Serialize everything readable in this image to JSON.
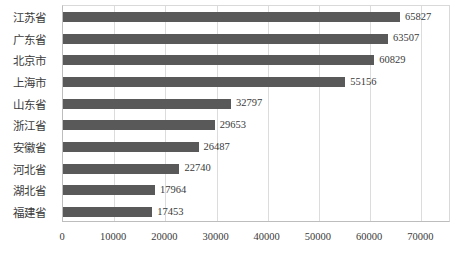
{
  "chart_data": {
    "type": "bar",
    "orientation": "horizontal",
    "title": "",
    "subtitle": "",
    "xlabel": "",
    "ylabel": "",
    "categories": [
      "江苏省",
      "广东省",
      "北京市",
      "上海市",
      "山东省",
      "浙江省",
      "安徽省",
      "河北省",
      "湖北省",
      "福建省"
    ],
    "values": [
      65827,
      63507,
      60829,
      55156,
      32797,
      29653,
      26487,
      22740,
      17964,
      17453
    ],
    "value_labels": [
      "65827",
      "63507",
      "60829",
      "55156",
      "32797",
      "29653",
      "26487",
      "22740",
      "17964",
      "17453"
    ],
    "xticks": [
      0,
      10000,
      20000,
      30000,
      40000,
      50000,
      60000,
      70000
    ],
    "xtick_labels": [
      "0",
      "10000",
      "20000",
      "30000",
      "40000",
      "50000",
      "60000",
      "70000"
    ],
    "xlim": [
      0,
      75800
    ],
    "grid": "vertical",
    "legend": "none",
    "bar_color": "#595959",
    "grid_color": "#dcdcdc",
    "axis_color": "#bdbdbd",
    "text_color": "#3a3a3a",
    "background": "#ffffff"
  }
}
